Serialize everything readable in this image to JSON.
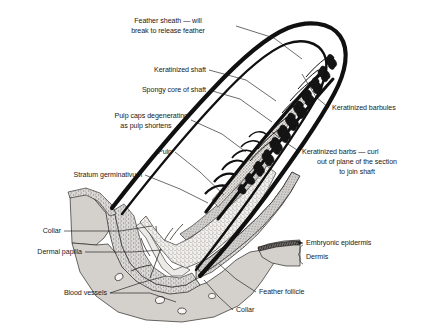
{
  "figure": {
    "domain": "biological-diagram"
  },
  "colors": {
    "ink": "#1a1a1a",
    "outline_black": "#101010",
    "dermis_fill": "#d4d0cb",
    "pulp_fill": "#eeece8",
    "sheath_fill": "#ffffff",
    "background": "#ffffff",
    "barb_dark": "#141414",
    "stipple": "#8a8782"
  },
  "labels": {
    "feather_sheath": {
      "lines": [
        "Feather sheath — will",
        "break to release feather"
      ]
    },
    "keratinized_shaft": {
      "lines": [
        "Keratinized shaft"
      ]
    },
    "spongy_core": {
      "lines": [
        "Spongy core of shaft"
      ]
    },
    "pulp_caps": {
      "lines": [
        "Pulp caps degenerating",
        "as pulp shortens"
      ]
    },
    "pulp": {
      "lines": [
        "Pulp"
      ]
    },
    "stratum_germinativum": {
      "lines": [
        "Stratum germinativum"
      ]
    },
    "collar_left": {
      "lines": [
        "Collar"
      ]
    },
    "dermal_papilla": {
      "lines": [
        "Dermal papilla"
      ]
    },
    "blood_vessels": {
      "lines": [
        "Blood vessels"
      ]
    },
    "keratinized_barbules": {
      "lines": [
        "Keratinized barbules"
      ]
    },
    "keratinized_barbs": {
      "lines": [
        "Keratinized barbs — curl",
        "out of plane of the section",
        "to join shaft"
      ]
    },
    "embryonic_epidermis": {
      "lines": [
        "Embryonic epidermis"
      ]
    },
    "dermis": {
      "lines": [
        "Dermis"
      ]
    },
    "feather_follicle": {
      "lines": [
        "Feather follicle"
      ]
    },
    "collar_bottom": {
      "lines": [
        "Collar"
      ]
    }
  }
}
